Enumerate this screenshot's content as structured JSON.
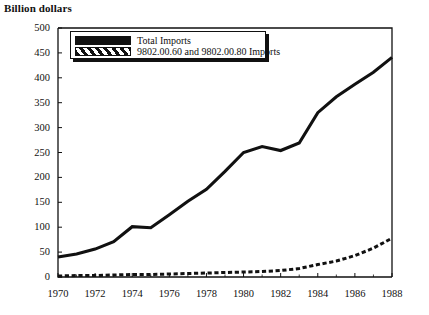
{
  "chart_data": {
    "type": "line",
    "title": "",
    "ylabel": "Billion dollars",
    "xlabel": "",
    "ylim": [
      0,
      500
    ],
    "xlim": [
      1970,
      1988
    ],
    "grid": false,
    "legend_position": "top-left-inside",
    "y_ticks": [
      500,
      450,
      400,
      350,
      300,
      250,
      200,
      150,
      100,
      50,
      0
    ],
    "x_ticks": [
      1970,
      1972,
      1974,
      1976,
      1978,
      1980,
      1982,
      1984,
      1986,
      1988
    ],
    "x": [
      1970,
      1971,
      1972,
      1973,
      1974,
      1975,
      1976,
      1977,
      1978,
      1979,
      1980,
      1981,
      1982,
      1983,
      1984,
      1985,
      1986,
      1987,
      1988
    ],
    "series": [
      {
        "name": "Total Imports",
        "style": "solid-thick",
        "color": "#111111",
        "values": [
          40,
          46,
          56,
          71,
          101,
          99,
          125,
          152,
          176,
          212,
          250,
          262,
          254,
          269,
          330,
          362,
          387,
          411,
          441
        ]
      },
      {
        "name": "9802.00.60 and 9802.00.80 Imports",
        "style": "dashed-hatched",
        "color": "#111111",
        "values": [
          2,
          3,
          3,
          4,
          5,
          5,
          6,
          7,
          8,
          9,
          10,
          11,
          13,
          17,
          25,
          32,
          43,
          58,
          78
        ]
      }
    ]
  },
  "legend": {
    "entries": [
      {
        "label": "Total Imports",
        "swatch": "solid"
      },
      {
        "label": "9802.00.60 and 9802.00.80 Imports",
        "swatch": "hatched"
      }
    ]
  },
  "axis": {
    "y_title": "Billion dollars"
  }
}
